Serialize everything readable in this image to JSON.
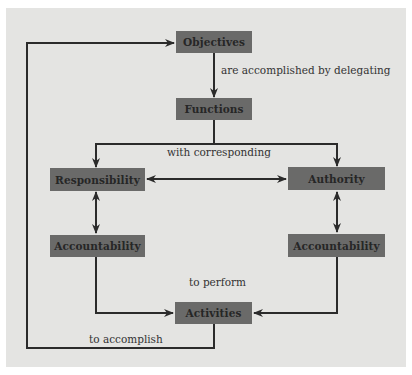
{
  "diagram": {
    "type": "flowchart",
    "colors": {
      "background": "#e4e4e2",
      "node_fill": "#6a6a69",
      "node_text": "#262626",
      "edge": "#2b2b2b",
      "label_text": "#333333"
    },
    "nodes": {
      "objectives": "Objectives",
      "functions": "Functions",
      "responsibility": "Responsibility",
      "authority": "Authority",
      "accountability_left": "Accountability",
      "accountability_right": "Accountability",
      "activities": "Activities"
    },
    "edge_labels": {
      "objectives_to_functions": "are accomplished by delegating",
      "functions_split": "with corresponding",
      "to_activities": "to perform",
      "activities_to_objectives": "to accomplish"
    },
    "edges": [
      {
        "from": "Objectives",
        "to": "Functions",
        "label": "are accomplished by delegating",
        "type": "arrow"
      },
      {
        "from": "Functions",
        "to": "Responsibility",
        "label": "with corresponding",
        "type": "arrow"
      },
      {
        "from": "Functions",
        "to": "Authority",
        "label": "with corresponding",
        "type": "arrow"
      },
      {
        "from": "Responsibility",
        "to": "Authority",
        "type": "double-arrow"
      },
      {
        "from": "Responsibility",
        "to": "Accountability (left)",
        "type": "double-arrow"
      },
      {
        "from": "Authority",
        "to": "Accountability (right)",
        "type": "double-arrow"
      },
      {
        "from": "Accountability (left)",
        "to": "Activities",
        "label": "to perform",
        "type": "arrow"
      },
      {
        "from": "Accountability (right)",
        "to": "Activities",
        "label": "to perform",
        "type": "arrow"
      },
      {
        "from": "Activities",
        "to": "Objectives",
        "label": "to accomplish",
        "type": "arrow"
      }
    ]
  }
}
